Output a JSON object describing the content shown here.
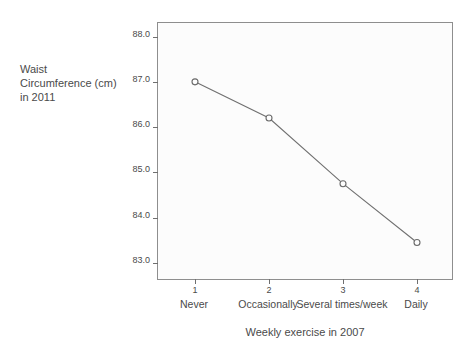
{
  "chart_data": {
    "type": "line",
    "title": "",
    "xlabel": "Weekly exercise in 2007",
    "ylabel": "Waist\nCircumference (cm)\nin 2011",
    "categories": [
      "Never",
      "Occasionally",
      "Several times/week",
      "Daily"
    ],
    "x": [
      1,
      2,
      3,
      4
    ],
    "x_tick_labels": [
      "1",
      "2",
      "3",
      "4"
    ],
    "values": [
      87.0,
      86.2,
      84.75,
      83.45
    ],
    "series": [
      {
        "name": "Waist Circumference (cm) in 2011",
        "values": [
          87.0,
          86.2,
          84.75,
          83.45
        ]
      }
    ],
    "y_tick_labels": [
      "88.0",
      "87.0",
      "86.0",
      "85.0",
      "84.0",
      "83.0"
    ],
    "y_ticks": [
      88.0,
      87.0,
      86.0,
      85.0,
      84.0,
      83.0
    ],
    "ylim": [
      82.6,
      88.3
    ],
    "xlim": [
      0.5,
      4.5
    ],
    "grid": false,
    "legend": false,
    "marker": "open-circle",
    "line_color": "#707070",
    "marker_color": "#6a6a6a",
    "plot_background": "#fcfcfc",
    "axis_color": "#8e8e8e",
    "text_color": "#4a4a4a"
  },
  "axes": {
    "y_title": "Waist\nCircumference (cm)\nin 2011",
    "x_title": "Weekly exercise in 2007"
  }
}
